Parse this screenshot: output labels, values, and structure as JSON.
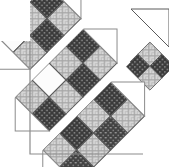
{
  "image": {
    "kind": "quilt-block-diagram",
    "title": "Diagonal Strip Quilt Block",
    "width": 169,
    "height": 167,
    "background_color": "#ffffff"
  },
  "palette": {
    "background": "#ffffff",
    "sashing_white": "#ffffff",
    "outline_dark": "#4a4a4a",
    "outline_light": "#8c8c8c",
    "dark_fabric_base": "#3a3a3a",
    "dark_fabric_dot": "#b9b9b9",
    "light_fabric_base": "#d5d5d5",
    "light_fabric_line": "#9a9a9a",
    "plain_fabric": "#fcfcfc"
  },
  "fabrics": [
    {
      "id": "dark",
      "name": "dark-dotted-fabric",
      "base": "#3a3a3a",
      "motif": "#b9b9b9",
      "motif_type": "dots"
    },
    {
      "id": "light",
      "name": "light-crosshatch-fabric",
      "base": "#d5d5d5",
      "motif": "#9a9a9a",
      "motif_type": "crosshatch"
    },
    {
      "id": "plain",
      "name": "plain-white-fabric",
      "base": "#fcfcfc",
      "motif": "#fcfcfc",
      "motif_type": "none"
    }
  ],
  "geometry": {
    "square_size": 24,
    "sashing_width": 9,
    "rotation_degrees": -45,
    "band_count": 4,
    "description": "Four diagonal bands running from lower-left to upper-right, each a two-wide checkerboard of squares, separated by white sashing strips, finished with right-triangle ends."
  },
  "bands": [
    {
      "index": 0,
      "name": "band-outer-left",
      "squares_per_row": 4,
      "rows": [
        [
          "light",
          "dark",
          "light",
          "dark"
        ],
        [
          "dark",
          "light",
          "dark",
          "light"
        ]
      ]
    },
    {
      "index": 1,
      "name": "band-second",
      "squares_per_row": 4,
      "rows": [
        [
          "light",
          "plain",
          "light",
          "dark"
        ],
        [
          "dark",
          "light",
          "dark",
          "light"
        ]
      ]
    },
    {
      "index": 2,
      "name": "band-third",
      "squares_per_row": 3,
      "rows": [
        [
          "plain",
          "light",
          "dark"
        ],
        [
          "light",
          "dark",
          "light"
        ]
      ]
    },
    {
      "index": 3,
      "name": "band-outer-right",
      "squares_per_row": 2,
      "rows": [
        [
          "light",
          "dark"
        ],
        [
          "dark",
          "light"
        ]
      ]
    }
  ],
  "border": {
    "has_left_border": true,
    "has_bottom_border": true,
    "stroke_color": "#8c8c8c",
    "stroke_width": 1
  }
}
